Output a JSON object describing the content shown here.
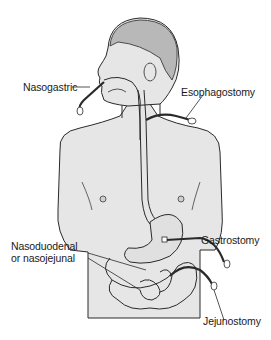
{
  "figure": {
    "colors": {
      "skin_fill": "#e6e6e6",
      "hair_fill": "#b8b8b8",
      "outline": "#2a2a2a",
      "background": "#ffffff"
    },
    "labels": [
      {
        "id": "nasogastric",
        "text": "Nasogastric"
      },
      {
        "id": "esophagostomy",
        "text": "Esophagostomy"
      },
      {
        "id": "nasoduodenal",
        "text": "Nasoduodenal"
      },
      {
        "id": "nasojejunal",
        "text": "or nasojejunal"
      },
      {
        "id": "gastrostomy",
        "text": "Gastrostomy"
      },
      {
        "id": "jejunostomy",
        "text": "Jejunostomy"
      }
    ],
    "caption_partial": "..."
  }
}
